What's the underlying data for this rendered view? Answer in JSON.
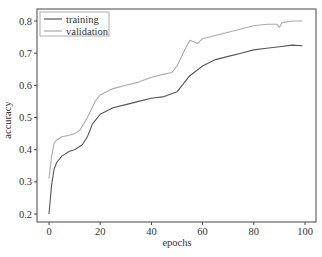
{
  "chart_data": {
    "type": "line",
    "title": "",
    "xlabel": "epochs",
    "ylabel": "accuracy",
    "xlim": [
      -5,
      104
    ],
    "ylim": [
      0.18,
      0.84
    ],
    "xticks": [
      0,
      20,
      40,
      60,
      80,
      100
    ],
    "yticks": [
      0.2,
      0.3,
      0.4,
      0.5,
      0.6,
      0.7,
      0.8
    ],
    "xtick_labels": [
      "0",
      "20",
      "40",
      "60",
      "80",
      "100"
    ],
    "ytick_labels": [
      "0.2",
      "0.3",
      "0.4",
      "0.5",
      "0.6",
      "0.7",
      "0.8"
    ],
    "grid": false,
    "legend_position": "upper left",
    "series": [
      {
        "name": "training",
        "color": "#555555",
        "x": [
          0,
          1,
          2,
          3,
          5,
          8,
          10,
          13,
          15,
          17,
          20,
          25,
          30,
          35,
          40,
          45,
          50,
          52,
          55,
          60,
          65,
          70,
          75,
          80,
          85,
          90,
          95,
          99
        ],
        "values": [
          0.2,
          0.29,
          0.34,
          0.36,
          0.38,
          0.395,
          0.4,
          0.415,
          0.44,
          0.48,
          0.51,
          0.53,
          0.54,
          0.55,
          0.56,
          0.565,
          0.58,
          0.6,
          0.63,
          0.66,
          0.68,
          0.69,
          0.7,
          0.71,
          0.715,
          0.72,
          0.725,
          0.723
        ]
      },
      {
        "name": "validation",
        "color": "#aaaaaa",
        "x": [
          0,
          1,
          2,
          3,
          5,
          8,
          10,
          12,
          15,
          18,
          20,
          25,
          30,
          35,
          40,
          45,
          48,
          50,
          53,
          55,
          58,
          60,
          65,
          70,
          75,
          80,
          85,
          89,
          90,
          91,
          95,
          99
        ],
        "values": [
          0.31,
          0.38,
          0.42,
          0.43,
          0.44,
          0.445,
          0.45,
          0.46,
          0.5,
          0.55,
          0.57,
          0.59,
          0.6,
          0.61,
          0.625,
          0.635,
          0.64,
          0.66,
          0.71,
          0.74,
          0.73,
          0.745,
          0.755,
          0.765,
          0.775,
          0.785,
          0.79,
          0.79,
          0.78,
          0.795,
          0.8,
          0.8
        ]
      }
    ]
  },
  "legend": {
    "items": [
      {
        "label": "training",
        "color": "#555555"
      },
      {
        "label": "validation",
        "color": "#aaaaaa"
      }
    ]
  },
  "axes": {
    "xlabel": "epochs",
    "ylabel": "accuracy"
  }
}
